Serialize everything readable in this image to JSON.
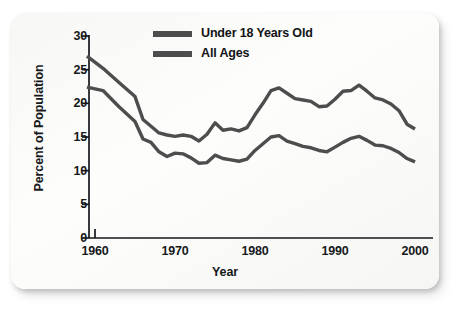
{
  "chart_data": {
    "type": "line",
    "title": "",
    "xlabel": "Year",
    "ylabel": "Percent of Population",
    "xlim": [
      1959,
      2001
    ],
    "ylim": [
      0,
      30
    ],
    "xticks": [
      1960,
      1970,
      1980,
      1990,
      2000
    ],
    "xtick_labels": [
      "1960",
      "1970",
      "1980",
      "1990",
      "2000"
    ],
    "yticks": [
      0,
      5,
      10,
      15,
      20,
      25,
      30
    ],
    "ytick_labels": [
      "0",
      "5",
      "10",
      "15",
      "20",
      "25",
      "30"
    ],
    "grid": false,
    "legend_position": "top-center",
    "line_color": "#4d4d4d",
    "series": [
      {
        "name": "Under 18 Years Old",
        "x": [
          1959,
          1961,
          1963,
          1965,
          1966,
          1967,
          1968,
          1969,
          1970,
          1971,
          1972,
          1973,
          1974,
          1975,
          1976,
          1977,
          1978,
          1979,
          1980,
          1981,
          1982,
          1983,
          1984,
          1985,
          1986,
          1987,
          1988,
          1989,
          1990,
          1991,
          1992,
          1993,
          1994,
          1995,
          1996,
          1997,
          1998,
          1999,
          2000
        ],
        "y": [
          27.0,
          25.2,
          23.1,
          21.0,
          17.6,
          16.6,
          15.6,
          15.3,
          15.1,
          15.3,
          15.1,
          14.4,
          15.4,
          17.1,
          16.0,
          16.2,
          15.9,
          16.4,
          18.3,
          20.0,
          21.9,
          22.3,
          21.5,
          20.7,
          20.5,
          20.3,
          19.5,
          19.6,
          20.6,
          21.8,
          21.9,
          22.7,
          21.8,
          20.8,
          20.5,
          19.9,
          18.9,
          16.9,
          16.2
        ],
        "style": "solid",
        "linewidth": 3.4
      },
      {
        "name": "All Ages",
        "x": [
          1959,
          1961,
          1963,
          1965,
          1966,
          1967,
          1968,
          1969,
          1970,
          1971,
          1972,
          1973,
          1974,
          1975,
          1976,
          1977,
          1978,
          1979,
          1980,
          1981,
          1982,
          1983,
          1984,
          1985,
          1986,
          1987,
          1988,
          1989,
          1990,
          1991,
          1992,
          1993,
          1994,
          1995,
          1996,
          1997,
          1998,
          1999,
          2000
        ],
        "y": [
          22.4,
          21.9,
          19.5,
          17.3,
          14.7,
          14.2,
          12.8,
          12.1,
          12.6,
          12.5,
          11.9,
          11.1,
          11.2,
          12.3,
          11.8,
          11.6,
          11.4,
          11.7,
          13.0,
          14.0,
          15.0,
          15.2,
          14.4,
          14.0,
          13.6,
          13.4,
          13.0,
          12.8,
          13.5,
          14.2,
          14.8,
          15.1,
          14.5,
          13.8,
          13.7,
          13.3,
          12.7,
          11.8,
          11.3
        ],
        "style": "solid",
        "linewidth": 3.4
      }
    ]
  },
  "legend": {
    "items": [
      {
        "label": "Under 18 Years Old"
      },
      {
        "label": "All Ages"
      }
    ]
  },
  "axes": {
    "ylabel": "Percent of Population",
    "xlabel": "Year"
  }
}
